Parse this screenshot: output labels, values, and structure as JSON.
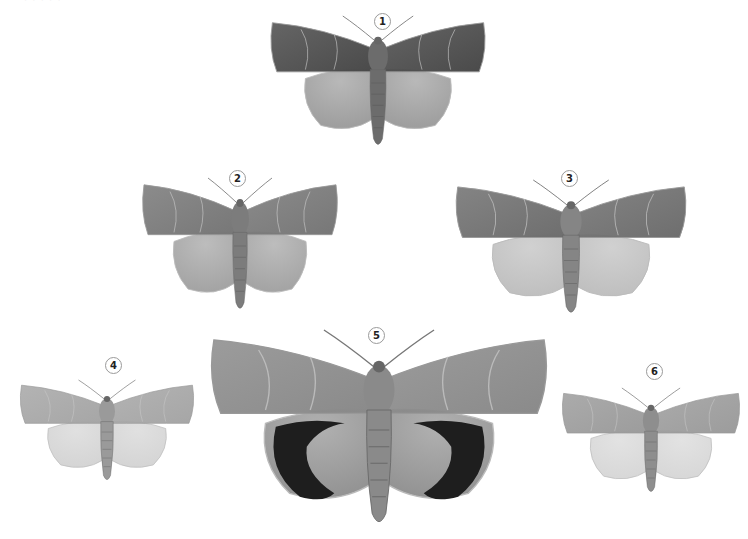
{
  "plate": {
    "header_fragment": "· · · · ·",
    "background": "#ffffff",
    "specimens": [
      {
        "number": "1",
        "label_x": 374,
        "label_y": 13,
        "x": 268,
        "y": 16,
        "w": 220,
        "h": 134,
        "forewing": "#4a4a4a",
        "hindwing": "#9a9a9a",
        "body": "#6c6c6c",
        "hind_band": null
      },
      {
        "number": "2",
        "label_x": 229,
        "label_y": 170,
        "x": 140,
        "y": 178,
        "w": 200,
        "h": 136,
        "forewing": "#777777",
        "hindwing": "#a0a0a0",
        "body": "#7c7c7c",
        "hind_band": null
      },
      {
        "number": "3",
        "label_x": 561,
        "label_y": 170,
        "x": 453,
        "y": 180,
        "w": 236,
        "h": 138,
        "forewing": "#6e6e6e",
        "hindwing": "#bdbdbd",
        "body": "#858585",
        "hind_band": null
      },
      {
        "number": "4",
        "label_x": 105,
        "label_y": 357,
        "x": 18,
        "y": 380,
        "w": 178,
        "h": 104,
        "forewing": "#a6a6a6",
        "hindwing": "#d3d3d3",
        "body": "#9a9a9a",
        "hind_band": null
      },
      {
        "number": "5",
        "label_x": 368,
        "label_y": 327,
        "x": 207,
        "y": 330,
        "w": 344,
        "h": 200,
        "forewing": "#8a8a8a",
        "hindwing": "#8f8f8f",
        "body": "#8a8a8a",
        "hind_band": "#1e1e1e"
      },
      {
        "number": "6",
        "label_x": 646,
        "label_y": 363,
        "x": 560,
        "y": 388,
        "w": 182,
        "h": 108,
        "forewing": "#9c9c9c",
        "hindwing": "#d6d6d6",
        "body": "#8e8e8e",
        "hind_band": null
      }
    ]
  }
}
